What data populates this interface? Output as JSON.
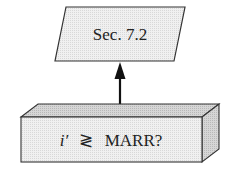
{
  "diagram": {
    "top_node": {
      "shape": "parallelogram",
      "label": "Sec. 7.2",
      "fill": "#ececec",
      "stroke": "#333333"
    },
    "connector": {
      "direction": "up",
      "from": "bottom_node",
      "to": "top_node",
      "color": "#111111"
    },
    "bottom_node": {
      "shape": "3d-box",
      "label_var": "i′",
      "label_op": "≷",
      "label_rest": "MARR?",
      "front_fill": "#efefef",
      "top_fill": "#dcdcdc",
      "side_fill": "#cfcfcf",
      "stroke": "#333333"
    }
  }
}
